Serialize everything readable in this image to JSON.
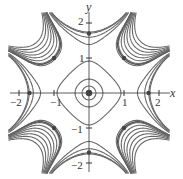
{
  "figure": {
    "type": "contour/phase portrait",
    "axes": {
      "x_label": "x",
      "y_label": "y",
      "x_ticks": [
        "−2",
        "−1",
        "1",
        "2"
      ],
      "y_ticks": [
        "2",
        "1",
        "−1",
        "−2"
      ],
      "xlim": [
        -2,
        2
      ],
      "ylim": [
        -2,
        2
      ]
    },
    "equilibria": [
      {
        "x": 0,
        "y": 0,
        "type": "center"
      },
      {
        "x": 1.7,
        "y": 0,
        "type": "center"
      },
      {
        "x": -1.7,
        "y": 0,
        "type": "center"
      },
      {
        "x": 0,
        "y": 1.7,
        "type": "center"
      },
      {
        "x": 0,
        "y": -1.7,
        "type": "center"
      },
      {
        "x": 1,
        "y": 1,
        "type": "saddle"
      },
      {
        "x": -1,
        "y": 1,
        "type": "saddle"
      },
      {
        "x": 1,
        "y": -1,
        "type": "saddle"
      },
      {
        "x": -1,
        "y": -1,
        "type": "saddle"
      }
    ],
    "colors": {
      "curve": "#666666",
      "separatrix": "#555555",
      "axis": "#333333",
      "dot": "#444444"
    }
  }
}
